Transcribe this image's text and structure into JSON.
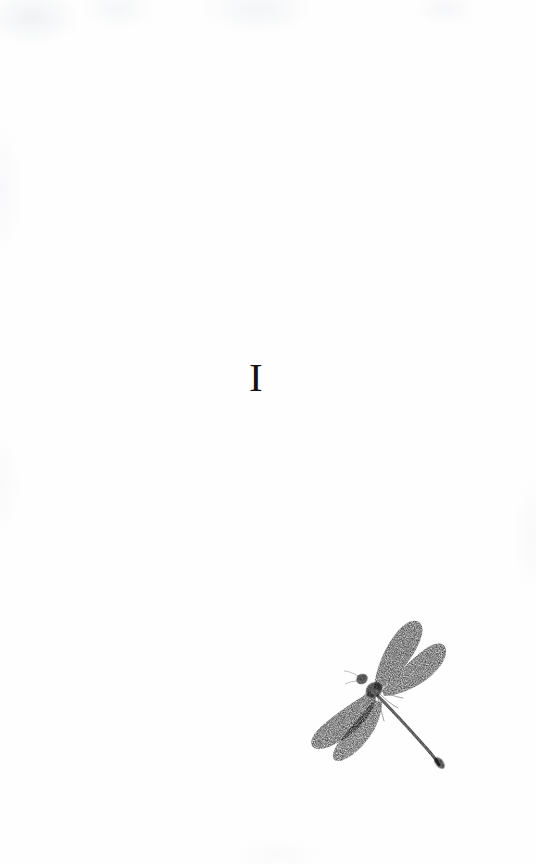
{
  "page": {
    "width": 536,
    "height": 864,
    "background_color": "#fefefe",
    "kind": "book-chapter-opening-page"
  },
  "chapter": {
    "numeral": "I"
  },
  "illustration": {
    "name": "dragonfly",
    "subject": "damselfly / dragonfly engraving",
    "style": "stippled engraving",
    "ink_color": "#8c8c90",
    "body_color": "#6f6f73",
    "position": {
      "x": 296,
      "y": 608,
      "width": 160,
      "height": 168
    },
    "parts": [
      "upper-left-wing",
      "upper-right-wing",
      "lower-left-wing",
      "lower-right-wing",
      "head",
      "thorax",
      "abdomen",
      "legs"
    ]
  }
}
